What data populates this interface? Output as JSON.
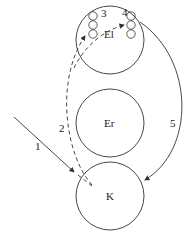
{
  "diagram": {
    "nodes": [
      {
        "id": "El",
        "label": "El"
      },
      {
        "id": "Er",
        "label": "Er"
      },
      {
        "id": "K",
        "label": "K"
      }
    ],
    "arrows": [
      {
        "id": "1",
        "label": "1",
        "style": "solid"
      },
      {
        "id": "2",
        "label": "2",
        "style": "dashed"
      },
      {
        "id": "3",
        "label": "3",
        "style": "dashed"
      },
      {
        "id": "4",
        "label": "4",
        "style": "dashed"
      },
      {
        "id": "5",
        "label": "5",
        "style": "solid"
      }
    ],
    "colors": {
      "line": "#333333",
      "background": "#ffffff"
    }
  }
}
